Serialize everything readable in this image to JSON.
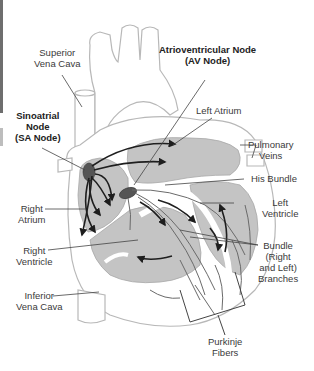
{
  "diagram": {
    "colors": {
      "background": "#ffffff",
      "outline": "#b8b8b8",
      "chamber_fill": "#c4c4c4",
      "node_fill": "#555555",
      "arrow": "#1e1e1e",
      "leader_line": "#444444",
      "label_text": "#3a3a3a"
    },
    "labels": {
      "superior_vena_cava": {
        "line1": "Superior",
        "line2": "Vena Cava"
      },
      "av_node": {
        "line1": "Atrioventricular Node",
        "line2": "(AV Node)"
      },
      "sa_node": {
        "line1": "Sinoatrial",
        "line2": "Node",
        "line3": "(SA Node)"
      },
      "left_atrium": {
        "line1": "Left Atrium"
      },
      "pulmonary_veins": {
        "line1": "Pulmonary",
        "line2": "Veins"
      },
      "his_bundle": {
        "line1": "His Bundle"
      },
      "left_ventricle": {
        "line1": "Left",
        "line2": "Ventricle"
      },
      "right_atrium": {
        "line1": "Right",
        "line2": "Atrium"
      },
      "right_ventricle": {
        "line1": "Right",
        "line2": "Ventricle"
      },
      "bundle_branches": {
        "line1": "Bundle",
        "line2": "(Right",
        "line3": "and Left)",
        "line4": "Branches"
      },
      "inferior_vena_cava": {
        "line1": "Inferior",
        "line2": "Vena Cava"
      },
      "purkinje_fibers": {
        "line1": "Purkinje",
        "line2": "Fibers"
      }
    }
  }
}
